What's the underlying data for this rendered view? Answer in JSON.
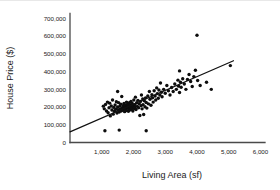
{
  "chart_data": {
    "type": "scatter",
    "title": "",
    "xlabel": "Living Area (sf)",
    "ylabel": "House Price ($)",
    "xlim": [
      0,
      6200
    ],
    "ylim": [
      0,
      720000
    ],
    "grid": false,
    "legend": "none",
    "x_tick_labels": [
      "1,000",
      "2,000",
      "3,000",
      "4,000",
      "5,000",
      "6,000"
    ],
    "x_tick_values": [
      1000,
      2000,
      3000,
      4000,
      5000,
      6000
    ],
    "y_tick_labels": [
      "0",
      "100,000",
      "200,000",
      "300,000",
      "400,000",
      "500,000",
      "600,000",
      "700,000"
    ],
    "y_tick_values": [
      0,
      100000,
      200000,
      300000,
      400000,
      500000,
      600000,
      700000
    ],
    "marker_color": "#0d0d0d",
    "marker_size": 1.7,
    "trendline": {
      "label": "linear fit",
      "color": "#111111",
      "intercept": 60000,
      "slope": 78,
      "x_start": 0,
      "x_end": 5150,
      "y_start": 60000,
      "y_end": 461700
    },
    "n_points": 131,
    "points": [
      [
        1050,
        205000
      ],
      [
        1080,
        190000
      ],
      [
        1120,
        215000
      ],
      [
        1150,
        178000
      ],
      [
        1100,
        66000
      ],
      [
        1180,
        228000
      ],
      [
        1200,
        168000
      ],
      [
        1230,
        196000
      ],
      [
        1250,
        222000
      ],
      [
        1270,
        150000
      ],
      [
        1300,
        206000
      ],
      [
        1320,
        183000
      ],
      [
        1340,
        240000
      ],
      [
        1360,
        160000
      ],
      [
        1380,
        198000
      ],
      [
        1400,
        176000
      ],
      [
        1420,
        212000
      ],
      [
        1440,
        188000
      ],
      [
        1460,
        230000
      ],
      [
        1480,
        166000
      ],
      [
        1500,
        200000
      ],
      [
        1510,
        185000
      ],
      [
        1530,
        225000
      ],
      [
        1550,
        172000
      ],
      [
        1550,
        70000
      ],
      [
        1570,
        205000
      ],
      [
        1590,
        190000
      ],
      [
        1600,
        216000
      ],
      [
        1610,
        178000
      ],
      [
        1630,
        260000
      ],
      [
        1650,
        196000
      ],
      [
        1660,
        182000
      ],
      [
        1680,
        208000
      ],
      [
        1700,
        220000
      ],
      [
        1710,
        192000
      ],
      [
        1720,
        174000
      ],
      [
        1500,
        288000
      ],
      [
        1740,
        204000
      ],
      [
        1750,
        186000
      ],
      [
        1760,
        212000
      ],
      [
        1770,
        198000
      ],
      [
        1780,
        228000
      ],
      [
        1790,
        180000
      ],
      [
        1800,
        206000
      ],
      [
        1810,
        194000
      ],
      [
        1820,
        218000
      ],
      [
        1830,
        202000
      ],
      [
        1840,
        176000
      ],
      [
        1850,
        210000
      ],
      [
        1860,
        190000
      ],
      [
        1870,
        224000
      ],
      [
        1880,
        198000
      ],
      [
        1890,
        184000
      ],
      [
        1900,
        212000
      ],
      [
        1910,
        200000
      ],
      [
        1920,
        232000
      ],
      [
        1930,
        188000
      ],
      [
        1940,
        206000
      ],
      [
        1950,
        196000
      ],
      [
        1960,
        220000
      ],
      [
        1980,
        178000
      ],
      [
        2000,
        208000
      ],
      [
        2010,
        240000
      ],
      [
        2020,
        192000
      ],
      [
        2040,
        214000
      ],
      [
        2050,
        200000
      ],
      [
        2060,
        256000
      ],
      [
        2080,
        186000
      ],
      [
        2100,
        224000
      ],
      [
        2120,
        204000
      ],
      [
        2140,
        238000
      ],
      [
        2160,
        196000
      ],
      [
        2180,
        218000
      ],
      [
        2200,
        152000
      ],
      [
        2220,
        232000
      ],
      [
        2240,
        208000
      ],
      [
        2250,
        268000
      ],
      [
        2270,
        190000
      ],
      [
        2290,
        246000
      ],
      [
        2300,
        214000
      ],
      [
        2320,
        158000
      ],
      [
        2340,
        236000
      ],
      [
        2360,
        202000
      ],
      [
        2380,
        252000
      ],
      [
        2400,
        66000
      ],
      [
        2400,
        226000
      ],
      [
        2420,
        194000
      ],
      [
        2450,
        262000
      ],
      [
        2470,
        218000
      ],
      [
        2500,
        288000
      ],
      [
        2520,
        244000
      ],
      [
        2550,
        210000
      ],
      [
        2580,
        270000
      ],
      [
        2600,
        252000
      ],
      [
        2620,
        228000
      ],
      [
        2650,
        292000
      ],
      [
        2680,
        262000
      ],
      [
        2700,
        240000
      ],
      [
        2730,
        308000
      ],
      [
        2750,
        276000
      ],
      [
        2780,
        250000
      ],
      [
        2800,
        296000
      ],
      [
        2830,
        268000
      ],
      [
        2850,
        336000
      ],
      [
        2880,
        284000
      ],
      [
        2900,
        258000
      ],
      [
        2950,
        300000
      ],
      [
        3000,
        278000
      ],
      [
        3050,
        322000
      ],
      [
        3100,
        292000
      ],
      [
        3150,
        268000
      ],
      [
        3200,
        310000
      ],
      [
        3250,
        288000
      ],
      [
        3300,
        330000
      ],
      [
        3350,
        300000
      ],
      [
        3400,
        352000
      ],
      [
        3420,
        318000
      ],
      [
        3450,
        404000
      ],
      [
        3450,
        282000
      ],
      [
        3480,
        340000
      ],
      [
        3500,
        312000
      ],
      [
        3550,
        360000
      ],
      [
        3600,
        330000
      ],
      [
        3650,
        300000
      ],
      [
        3700,
        356000
      ],
      [
        3750,
        384000
      ],
      [
        3800,
        344000
      ],
      [
        3850,
        316000
      ],
      [
        3900,
        372000
      ],
      [
        3950,
        408000
      ],
      [
        4000,
        605000
      ],
      [
        4020,
        350000
      ],
      [
        4100,
        322000
      ],
      [
        4300,
        340000
      ],
      [
        4450,
        300000
      ],
      [
        5050,
        434000
      ]
    ]
  }
}
